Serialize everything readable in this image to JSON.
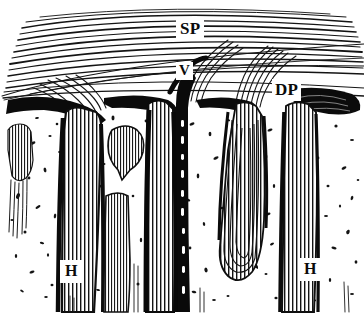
{
  "figure": {
    "kind": "anatomical-line-engraving",
    "background_color": "#ffffff",
    "ink_color": "#111111",
    "width": 364,
    "height": 315
  },
  "labels": [
    {
      "id": "sp",
      "text": "SP",
      "meaning": "superficial plexus",
      "x": 176,
      "y": 18
    },
    {
      "id": "v",
      "text": "V",
      "meaning": "vessel",
      "x": 176,
      "y": 62
    },
    {
      "id": "dp",
      "text": "DP",
      "meaning": "deep plexus",
      "x": 272,
      "y": 79
    },
    {
      "id": "h-left",
      "text": "H",
      "meaning": "hair",
      "x": 60,
      "y": 260
    },
    {
      "id": "h-right",
      "text": "H",
      "meaning": "hair",
      "x": 299,
      "y": 258
    }
  ],
  "regions": {
    "upper_layer": "stratified horizontal fiber bands (epidermis / superficial plexus)",
    "boundary": "dense black dermal boundary wedges",
    "dermis": "stippled connective tissue with irregular dark flecks",
    "follicles": "five vertical striated hair follicles, one with rounded bulb"
  }
}
